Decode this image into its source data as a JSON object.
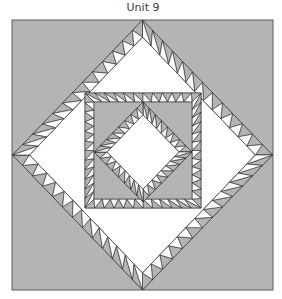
{
  "title": "Unit 9",
  "colors": {
    "background": "#b4b4b4",
    "light": "#ffffff",
    "stroke": "#2a2a2a",
    "frame": "#5a5a5a"
  },
  "frame": {
    "x": 12,
    "y": 20,
    "w": 261,
    "h": 270
  },
  "outer_diamond": {
    "cx": 142.5,
    "cy": 155,
    "rx": 130,
    "ry": 135,
    "strip": 12,
    "count": 13
  },
  "inner_square": {
    "x": 85,
    "y": 93,
    "w": 116,
    "h": 115,
    "strip": 9,
    "count": 12
  },
  "inner_diamond": {
    "cx": 143,
    "cy": 152,
    "rx": 49,
    "ry": 50,
    "strip": 9,
    "count": 8
  }
}
